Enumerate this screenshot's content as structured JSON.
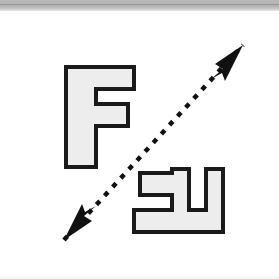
{
  "figure": {
    "title": "Rotation relation between two F shapes",
    "width": 279,
    "height": 279,
    "background_color": "#ffffff",
    "scan_band": {
      "name": "top-scan-band",
      "color": "#b4b4b4",
      "height": 11
    },
    "bottom_band": {
      "name": "bottom-scan-band",
      "color": "#f2f2f2",
      "height": 6
    }
  },
  "style": {
    "shape_fill": "#ededed",
    "shape_stroke": "#1a1a1a",
    "shape_stroke_width": 4,
    "axis_color": "#111111",
    "axis_dash_pattern": "5 7",
    "axis_stroke_width": 4.5
  },
  "shapes": [
    {
      "id": "shape-f-upright",
      "label": "F",
      "orientation_degrees": 0,
      "position": "upper-left",
      "bounds": {
        "x": 66,
        "y": 56,
        "width": 68,
        "height": 100
      },
      "points": "66,56 134,56 134,78 96,78 96,93 128,93 128,115 96,115 96,156 66,156",
      "fill": "#ededed",
      "stroke": "#1a1a1a"
    },
    {
      "id": "shape-f-rotated",
      "label": "F rotated 180 degrees",
      "orientation_degrees": 180,
      "position": "lower-right",
      "bounds": {
        "x": 134,
        "y": 158,
        "width": 89,
        "height": 63
      },
      "points": "223,221 134,221 134,199 172,199 172,184 140,184 140,162 172,162 172,158 189,158 189,199 206,199 206,158 223,158",
      "fill": "#ededed",
      "stroke": "#1a1a1a"
    }
  ],
  "axis": {
    "id": "rotation-axis",
    "name": "double-headed-dashed-arrow",
    "description": "Dashed double-headed arrow running from lower-left to upper-right",
    "start_point": {
      "x": 64,
      "y": 240
    },
    "end_point": {
      "x": 243,
      "y": 45
    },
    "dashed": true,
    "arrowheads": [
      "start",
      "end"
    ],
    "color": "#111111"
  },
  "arrowheads": [
    {
      "id": "arrowhead-upper-right",
      "name": "arrow-head-up-right-icon",
      "direction": "up-right",
      "tip": {
        "x": 243,
        "y": 45
      },
      "points": "243,45 215,64 223,69 211,79 222,73 225,81"
    },
    {
      "id": "arrowhead-lower-left",
      "name": "arrow-head-down-left-icon",
      "direction": "down-left",
      "tip": {
        "x": 64,
        "y": 240
      },
      "points": "64,240 92,221 84,216 96,206 85,212 82,204"
    }
  ]
}
